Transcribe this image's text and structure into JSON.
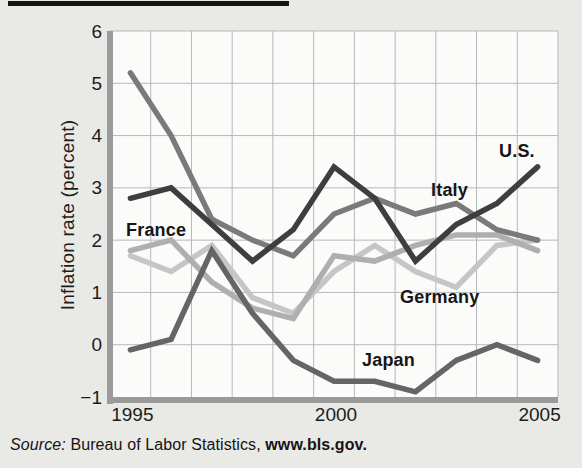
{
  "figure": {
    "y_axis_title": "Inflation rate (percent)",
    "source_prefix": "Source:",
    "source_body": " Bureau of Labor Statistics, ",
    "source_link": "www.bls.gov."
  },
  "chart_data": {
    "type": "line",
    "title": "",
    "xlabel": "",
    "ylabel": "Inflation rate (percent)",
    "x": [
      1995,
      1996,
      1997,
      1998,
      1999,
      2000,
      2001,
      2002,
      2003,
      2004,
      2005
    ],
    "x_ticks": [
      1995,
      2000,
      2005
    ],
    "x_tick_labels": [
      "1995",
      "2000",
      "2005"
    ],
    "ylim": [
      -1,
      6
    ],
    "y_ticks": [
      6,
      5,
      4,
      3,
      2,
      1,
      0,
      -1
    ],
    "y_tick_labels": [
      "6",
      "5",
      "4",
      "3",
      "2",
      "1",
      "0",
      "−1"
    ],
    "grid": true,
    "legend_position": "inline-labels",
    "colors": {
      "background": "#e9e9e6",
      "plot_background": "#fbfbf9",
      "gridline": "#b4b8bd",
      "axis": "#9a9a9a",
      "text": "#1c1c1c"
    },
    "series": [
      {
        "name": "Germany",
        "color": "#c6c6c6",
        "values": [
          1.7,
          1.4,
          1.9,
          0.9,
          0.6,
          1.4,
          1.9,
          1.4,
          1.1,
          1.9,
          2.0
        ],
        "label": {
          "text": "Germany",
          "x": 400,
          "y": 303
        }
      },
      {
        "name": "France",
        "color": "#afafaf",
        "values": [
          1.8,
          2.0,
          1.2,
          0.7,
          0.5,
          1.7,
          1.6,
          1.9,
          2.1,
          2.1,
          1.8
        ],
        "label": {
          "text": "France",
          "x": 126,
          "y": 236
        }
      },
      {
        "name": "Japan",
        "color": "#656565",
        "values": [
          -0.1,
          0.1,
          1.8,
          0.6,
          -0.3,
          -0.7,
          -0.7,
          -0.9,
          -0.3,
          0.0,
          -0.3
        ],
        "label": {
          "text": "Japan",
          "x": 362,
          "y": 366
        }
      },
      {
        "name": "Italy",
        "color": "#7a7a7a",
        "values": [
          5.2,
          4.0,
          2.4,
          2.0,
          1.7,
          2.5,
          2.8,
          2.5,
          2.7,
          2.2,
          2.0
        ],
        "label": {
          "text": "Italy",
          "x": 431,
          "y": 196
        }
      },
      {
        "name": "U.S.",
        "color": "#3e3e3e",
        "values": [
          2.8,
          3.0,
          2.3,
          1.6,
          2.2,
          3.4,
          2.8,
          1.6,
          2.3,
          2.7,
          3.4
        ],
        "label": {
          "text": "U.S.",
          "x": 499,
          "y": 157
        }
      }
    ]
  }
}
